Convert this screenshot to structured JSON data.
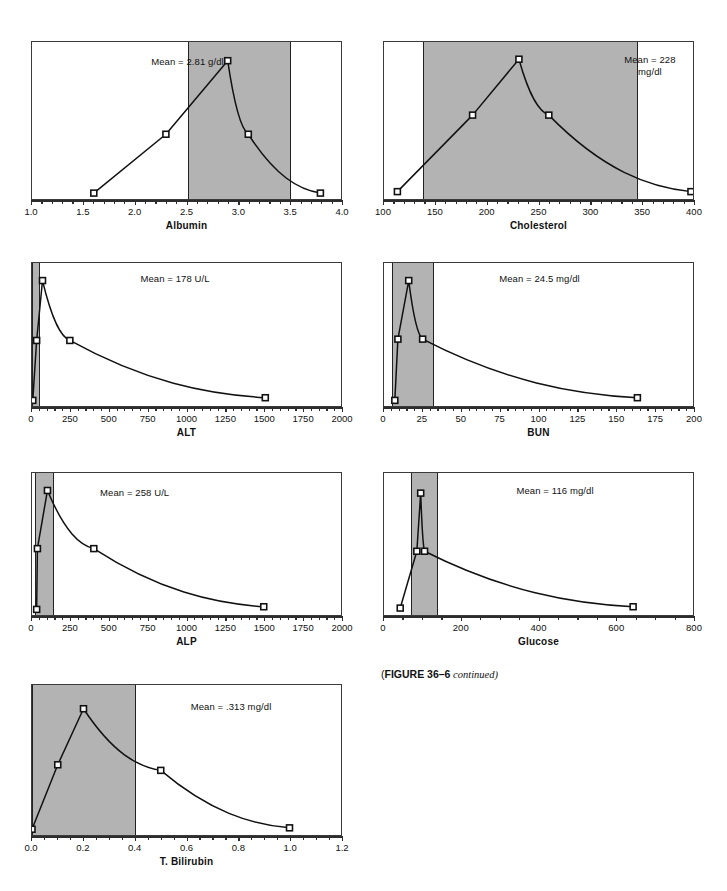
{
  "caption": {
    "open_paren": "(",
    "strong": "FIGURE 36–6",
    "italic": " continued",
    "close_paren": ")"
  },
  "charts": [
    {
      "id": "albumin",
      "title": "Albumin",
      "mean_label": "Mean = 2.81 g/dl",
      "xlim": [
        1.0,
        4.0
      ],
      "ticks": [
        1.0,
        1.5,
        2.0,
        2.5,
        3.0,
        3.5,
        4.0
      ],
      "tick_labels": [
        "1.0",
        "1.5",
        "2.0",
        "2.5",
        "3.0",
        "3.5",
        "4.0"
      ],
      "minor_step": 0.1,
      "band": [
        2.5,
        3.5
      ],
      "ylim": [
        0,
        100
      ],
      "x": [
        1.6,
        2.3,
        2.9,
        3.1,
        3.8
      ],
      "y": [
        2,
        42,
        92,
        42,
        2
      ],
      "markers": [
        true,
        true,
        true,
        true,
        true
      ]
    },
    {
      "id": "cholesterol",
      "title": "Cholesterol",
      "mean_label": "Mean = 228\nmg/dl",
      "xlim": [
        100,
        400
      ],
      "ticks": [
        100,
        150,
        200,
        250,
        300,
        350,
        400
      ],
      "tick_labels": [
        "100",
        "150",
        "200",
        "250",
        "300",
        "350",
        "400"
      ],
      "minor_step": 10,
      "band": [
        138,
        345
      ],
      "ylim": [
        0,
        100
      ],
      "x": [
        113,
        186,
        231,
        260,
        398
      ],
      "y": [
        3,
        55,
        93,
        55,
        3
      ],
      "markers": [
        true,
        true,
        true,
        true,
        true
      ]
    },
    {
      "id": "alt",
      "title": "ALT",
      "mean_label": "Mean = 178 U/L",
      "xlim": [
        0,
        2000
      ],
      "ticks": [
        0,
        250,
        500,
        750,
        1000,
        1250,
        1500,
        1750,
        2000
      ],
      "tick_labels": [
        "0",
        "250",
        "500",
        "750",
        "1000",
        "1250",
        "1500",
        "1750",
        "2000"
      ],
      "minor_step": 50,
      "band": [
        0,
        50
      ],
      "ylim": [
        0,
        100
      ],
      "x": [
        5,
        30,
        68,
        245,
        1510
      ],
      "y": [
        2,
        47,
        92,
        47,
        4
      ],
      "markers": [
        true,
        true,
        true,
        true,
        true
      ]
    },
    {
      "id": "bun",
      "title": "BUN",
      "mean_label": "Mean = 24.5 mg/dl",
      "xlim": [
        0,
        200
      ],
      "ticks": [
        0,
        25,
        50,
        75,
        100,
        125,
        150,
        175,
        200
      ],
      "tick_labels": [
        "0",
        "25",
        "50",
        "75",
        "100",
        "125",
        "150",
        "175",
        "200"
      ],
      "minor_step": 5,
      "band": [
        5,
        32
      ],
      "ylim": [
        0,
        100
      ],
      "x": [
        7,
        9,
        16,
        25,
        164
      ],
      "y": [
        2,
        48,
        92,
        48,
        4
      ],
      "markers": [
        true,
        true,
        true,
        true,
        true
      ]
    },
    {
      "id": "alp",
      "title": "ALP",
      "mean_label": "Mean = 258 U/L",
      "xlim": [
        0,
        2000
      ],
      "ticks": [
        0,
        250,
        500,
        750,
        1000,
        1250,
        1500,
        1750,
        2000
      ],
      "tick_labels": [
        "0",
        "250",
        "500",
        "750",
        "1000",
        "1250",
        "1500",
        "1750",
        "2000"
      ],
      "minor_step": 50,
      "band": [
        20,
        140
      ],
      "ylim": [
        0,
        100
      ],
      "x": [
        30,
        35,
        100,
        400,
        1500
      ],
      "y": [
        2,
        48,
        92,
        48,
        4
      ],
      "markers": [
        true,
        true,
        true,
        true,
        true
      ]
    },
    {
      "id": "glucose",
      "title": "Glucose",
      "mean_label": "Mean = 116 mg/dl",
      "xlim": [
        0,
        800
      ],
      "ticks": [
        0,
        200,
        400,
        600,
        800
      ],
      "tick_labels": [
        "0",
        "200",
        "400",
        "600",
        "800"
      ],
      "minor_step": 50,
      "band": [
        70,
        138
      ],
      "ylim": [
        0,
        100
      ],
      "x": [
        42,
        85,
        95,
        105,
        645
      ],
      "y": [
        3,
        46,
        90,
        46,
        4
      ],
      "markers": [
        true,
        true,
        true,
        true,
        true
      ]
    },
    {
      "id": "bilirubin",
      "title": "T. Bilirubin",
      "mean_label": "Mean = .313 mg/dl",
      "xlim": [
        0.0,
        1.2
      ],
      "ticks": [
        0.0,
        0.2,
        0.4,
        0.6,
        0.8,
        1.0,
        1.2
      ],
      "tick_labels": [
        "0.0",
        "0.2",
        "0.4",
        "0.6",
        "0.8",
        "1.0",
        "1.2"
      ],
      "minor_step": 0.05,
      "band": [
        0.0,
        0.4
      ],
      "ylim": [
        0,
        100
      ],
      "x": [
        0.0,
        0.1,
        0.2,
        0.5,
        1.0
      ],
      "y": [
        2,
        48,
        88,
        44,
        3
      ],
      "markers": [
        true,
        true,
        true,
        true,
        true
      ]
    }
  ],
  "chart_data": {
    "type": "line",
    "title": "(FIGURE 36–6 continued)",
    "ylabel": "",
    "grid": false,
    "legend": "none",
    "panels": [
      {
        "name": "Albumin",
        "xlabel": "Albumin",
        "units": "g/dl",
        "mean": 2.81,
        "mean_text": "Mean = 2.81 g/dl",
        "xlim": [
          1.0,
          4.0
        ],
        "xticks": [
          1.0,
          1.5,
          2.0,
          2.5,
          3.0,
          3.5,
          4.0
        ],
        "shaded_range": [
          2.5,
          3.5
        ],
        "x": [
          1.6,
          2.3,
          2.9,
          3.1,
          3.8
        ],
        "y_relative": [
          2,
          42,
          92,
          42,
          2
        ]
      },
      {
        "name": "Cholesterol",
        "xlabel": "Cholesterol",
        "units": "mg/dl",
        "mean": 228,
        "mean_text": "Mean = 228 mg/dl",
        "xlim": [
          100,
          400
        ],
        "xticks": [
          100,
          150,
          200,
          250,
          300,
          350,
          400
        ],
        "shaded_range": [
          138,
          345
        ],
        "x": [
          113,
          186,
          231,
          260,
          398
        ],
        "y_relative": [
          3,
          55,
          93,
          55,
          3
        ]
      },
      {
        "name": "ALT",
        "xlabel": "ALT",
        "units": "U/L",
        "mean": 178,
        "mean_text": "Mean = 178 U/L",
        "xlim": [
          0,
          2000
        ],
        "xticks": [
          0,
          250,
          500,
          750,
          1000,
          1250,
          1500,
          1750,
          2000
        ],
        "shaded_range": [
          0,
          50
        ],
        "x": [
          5,
          30,
          68,
          245,
          1510
        ],
        "y_relative": [
          2,
          47,
          92,
          47,
          4
        ]
      },
      {
        "name": "BUN",
        "xlabel": "BUN",
        "units": "mg/dl",
        "mean": 24.5,
        "mean_text": "Mean = 24.5 mg/dl",
        "xlim": [
          0,
          200
        ],
        "xticks": [
          0,
          25,
          50,
          75,
          100,
          125,
          150,
          175,
          200
        ],
        "shaded_range": [
          5,
          32
        ],
        "x": [
          7,
          9,
          16,
          25,
          164
        ],
        "y_relative": [
          2,
          48,
          92,
          48,
          4
        ]
      },
      {
        "name": "ALP",
        "xlabel": "ALP",
        "units": "U/L",
        "mean": 258,
        "mean_text": "Mean = 258 U/L",
        "xlim": [
          0,
          2000
        ],
        "xticks": [
          0,
          250,
          500,
          750,
          1000,
          1250,
          1500,
          1750,
          2000
        ],
        "shaded_range": [
          20,
          140
        ],
        "x": [
          30,
          35,
          100,
          400,
          1500
        ],
        "y_relative": [
          2,
          48,
          92,
          48,
          4
        ]
      },
      {
        "name": "Glucose",
        "xlabel": "Glucose",
        "units": "mg/dl",
        "mean": 116,
        "mean_text": "Mean = 116 mg/dl",
        "xlim": [
          0,
          800
        ],
        "xticks": [
          0,
          200,
          400,
          600,
          800
        ],
        "shaded_range": [
          70,
          138
        ],
        "x": [
          42,
          85,
          95,
          105,
          645
        ],
        "y_relative": [
          3,
          46,
          90,
          46,
          4
        ]
      },
      {
        "name": "T. Bilirubin",
        "xlabel": "T. Bilirubin",
        "units": "mg/dl",
        "mean": 0.313,
        "mean_text": "Mean = .313 mg/dl",
        "xlim": [
          0.0,
          1.2
        ],
        "xticks": [
          0.0,
          0.2,
          0.4,
          0.6,
          0.8,
          1.0,
          1.2
        ],
        "shaded_range": [
          0.0,
          0.4
        ],
        "x": [
          0.0,
          0.1,
          0.2,
          0.5,
          1.0
        ],
        "y_relative": [
          2,
          48,
          88,
          44,
          3
        ]
      }
    ]
  }
}
